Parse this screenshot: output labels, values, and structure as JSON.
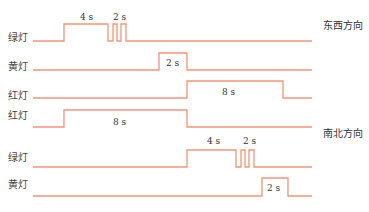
{
  "diagram": {
    "type": "traffic-light-timing",
    "signal_color": "#f2957a",
    "groups": [
      {
        "direction_label": "东西方向",
        "rows": [
          {
            "label": "绿灯",
            "duration_labels": [
              "4 s",
              "2 s"
            ]
          },
          {
            "label": "黄灯",
            "duration_labels": [
              "2 s"
            ]
          },
          {
            "label": "红灯",
            "duration_labels": [
              "8 s"
            ]
          }
        ]
      },
      {
        "direction_label": "南北方向",
        "rows": [
          {
            "label": "红灯",
            "duration_labels": [
              "8 s"
            ]
          },
          {
            "label": "绿灯",
            "duration_labels": [
              "4 s",
              "2 s"
            ]
          },
          {
            "label": "黄灯",
            "duration_labels": [
              "2 s"
            ]
          }
        ]
      }
    ]
  }
}
